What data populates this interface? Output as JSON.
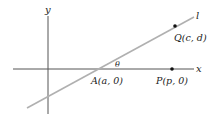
{
  "diagram": {
    "axes": {
      "x_label": "x",
      "y_label": "y"
    },
    "line": {
      "label": "l",
      "color": "#b0b0b0"
    },
    "angle": {
      "label": "θ"
    },
    "points": [
      {
        "id": "A",
        "label": "A(a, 0)"
      },
      {
        "id": "P",
        "label": "P(p, 0)"
      },
      {
        "id": "Q",
        "label": "Q(c, d)"
      }
    ],
    "colors": {
      "axis": "#555555",
      "point": "#111111",
      "text": "#222222"
    }
  }
}
